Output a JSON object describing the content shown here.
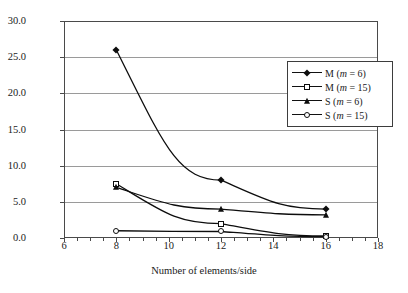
{
  "chart_data": {
    "type": "line",
    "title": "",
    "xlabel": "Number of elements/side",
    "ylabel": "Fraction of total energy (%)",
    "xlim": [
      6,
      18
    ],
    "ylim": [
      0,
      30
    ],
    "xticks": [
      "6",
      "8",
      "10",
      "12",
      "14",
      "16",
      "18"
    ],
    "yticks": [
      "0.0",
      "5.0",
      "10.0",
      "15.0",
      "20.0",
      "25.0",
      "30.0"
    ],
    "grid": "horizontal",
    "legend_position": "upper-right",
    "x": [
      8,
      12,
      16
    ],
    "series": [
      {
        "name": "M (m = 6)",
        "label_main": "M (",
        "label_var": "m",
        "label_tail": " = 6)",
        "marker": "filled-diamond",
        "values": [
          26.0,
          8.0,
          4.0
        ]
      },
      {
        "name": "M (m = 15)",
        "label_main": "M (",
        "label_var": "m",
        "label_tail": " = 15)",
        "marker": "open-square",
        "values": [
          7.5,
          2.0,
          0.3
        ]
      },
      {
        "name": "S (m = 6)",
        "label_main": "S (",
        "label_var": "m",
        "label_tail": " = 6)",
        "marker": "filled-triangle",
        "values": [
          7.0,
          4.0,
          3.2
        ]
      },
      {
        "name": "S (m = 15)",
        "label_main": "S (",
        "label_var": "m",
        "label_tail": " = 15)",
        "marker": "open-circle",
        "values": [
          1.0,
          0.9,
          0.2
        ]
      }
    ]
  },
  "axes": {
    "y_title": "Fraction of total energy (%)",
    "x_title": "Number of elements/side",
    "y_tick_labels": [
      "30.0",
      "25.0",
      "20.0",
      "15.0",
      "10.0",
      "5.0",
      "0.0"
    ],
    "x_tick_labels": [
      "6",
      "8",
      "10",
      "12",
      "14",
      "16",
      "18"
    ]
  },
  "legend": {
    "entries": [
      {
        "label_pre": "M (",
        "var": "m",
        "label_post": " = 6)"
      },
      {
        "label_pre": "M (",
        "var": "m",
        "label_post": " = 15)"
      },
      {
        "label_pre": "S (",
        "var": "m",
        "label_post": " = 6)"
      },
      {
        "label_pre": "S (",
        "var": "m",
        "label_post": " = 15)"
      }
    ]
  },
  "colors": {
    "line": "#0d0d0d",
    "grid": "#9a9a9a",
    "axis": "#4a4a4a",
    "background": "#ffffff"
  }
}
